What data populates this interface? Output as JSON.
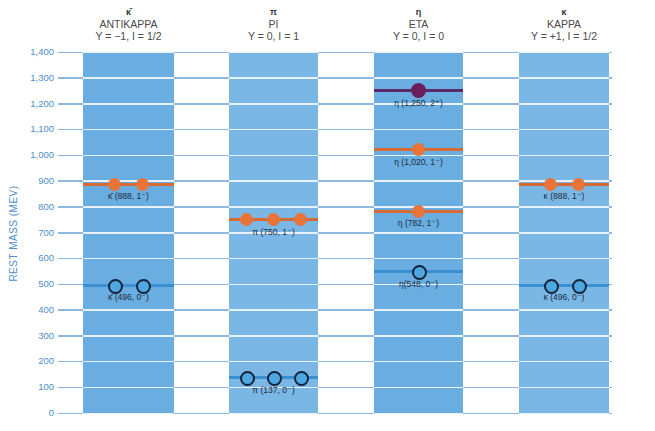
{
  "y_axis": {
    "label": "REST MASS (MEV)",
    "ticks": [
      "1,400",
      "1,300",
      "1,200",
      "1,100",
      "1,000",
      "900",
      "800",
      "700",
      "600",
      "500",
      "400",
      "300",
      "200",
      "100",
      "0"
    ],
    "min": 0,
    "max": 1400
  },
  "colors": {
    "column": "#6aade0",
    "grid_line": "#ffffff",
    "axis_text": "#4d8fc9",
    "vector_meson": "#e8743a",
    "pseudoscalar_meson": "#4ea7e0",
    "tensor_meson": "#6a1f5a"
  },
  "columns": [
    {
      "symbol": "κ̄",
      "name": "ANTIKAPPA",
      "quantum": "Y = −1, I = 1/2"
    },
    {
      "symbol": "π",
      "name": "PI",
      "quantum": "Y = 0, I = 1"
    },
    {
      "symbol": "η",
      "name": "ETA",
      "quantum": "Y = 0, I = 0"
    },
    {
      "symbol": "κ",
      "name": "KAPPA",
      "quantum": "Y = +1, I = 1/2"
    }
  ],
  "particles": [
    {
      "column": 0,
      "label": "κ̄ (888, 1⁻)",
      "mass": 888,
      "count": 2,
      "type": "vector"
    },
    {
      "column": 0,
      "label": "κ̄ (496, 0⁻)",
      "mass": 496,
      "count": 2,
      "type": "pseudoscalar"
    },
    {
      "column": 1,
      "label": "π (750, 1⁻)",
      "mass": 750,
      "count": 3,
      "type": "vector"
    },
    {
      "column": 1,
      "label": "π (137, 0⁻)",
      "mass": 137,
      "count": 3,
      "type": "pseudoscalar"
    },
    {
      "column": 2,
      "label": "η (1,250, 2⁺)",
      "mass": 1250,
      "count": 1,
      "type": "tensor"
    },
    {
      "column": 2,
      "label": "η (1,020, 1⁻)",
      "mass": 1020,
      "count": 1,
      "type": "vector"
    },
    {
      "column": 2,
      "label": "η (782, 1⁻)",
      "mass": 782,
      "count": 1,
      "type": "vector"
    },
    {
      "column": 2,
      "label": "η(548, 0⁻)",
      "mass": 548,
      "count": 1,
      "type": "pseudoscalar"
    },
    {
      "column": 3,
      "label": "κ (888, 1⁻)",
      "mass": 888,
      "count": 2,
      "type": "vector"
    },
    {
      "column": 3,
      "label": "κ (496, 0⁻)",
      "mass": 496,
      "count": 2,
      "type": "pseudoscalar"
    }
  ]
}
